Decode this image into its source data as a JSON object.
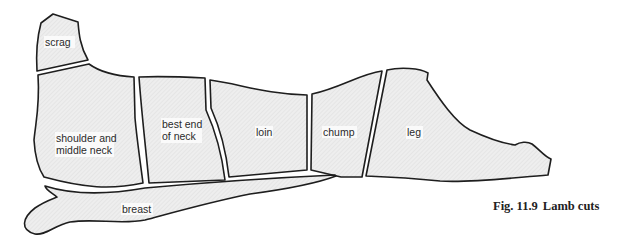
{
  "figure": {
    "number": "Fig. 11.9",
    "title": "Lamb cuts"
  },
  "cuts": [
    {
      "id": "scrag",
      "label_lines": [
        "scrag"
      ]
    },
    {
      "id": "shoulder-and-middle-neck",
      "label_lines": [
        "shoulder and",
        "middle neck"
      ]
    },
    {
      "id": "best-end-of-neck",
      "label_lines": [
        "best end",
        "of neck"
      ]
    },
    {
      "id": "loin",
      "label_lines": [
        "loin"
      ]
    },
    {
      "id": "chump",
      "label_lines": [
        "chump"
      ]
    },
    {
      "id": "leg",
      "label_lines": [
        "leg"
      ]
    },
    {
      "id": "breast",
      "label_lines": [
        "breast"
      ]
    }
  ],
  "colors": {
    "outline": "#1e1e1e",
    "fill": "#ebebeb",
    "background": "#ffffff"
  }
}
